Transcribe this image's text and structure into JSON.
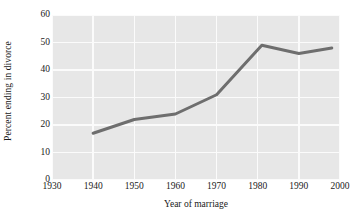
{
  "chart_data": {
    "type": "line",
    "title": "",
    "subtitle": "",
    "xlabel": "Year of marriage",
    "ylabel": "Percent ending in divorce",
    "xlim": [
      1930,
      2000
    ],
    "ylim": [
      0,
      60
    ],
    "xticks": [
      1930,
      1940,
      1950,
      1960,
      1970,
      1980,
      1990,
      2000
    ],
    "xtick_labels": [
      "1930",
      "1940",
      "1950",
      "1960",
      "1970",
      "1980",
      "1990",
      "2000"
    ],
    "yticks": [
      0,
      10,
      20,
      30,
      40,
      50,
      60
    ],
    "ytick_labels": [
      "0",
      "10",
      "20",
      "30",
      "40",
      "50",
      "60"
    ],
    "grid": true,
    "grid_color": "#fbfbfb",
    "plot_background": "#e7e7e7",
    "figure_background": "#ffffff",
    "legend": null,
    "legend_position": "none",
    "annotations": [],
    "series": [
      {
        "name": "Percent ending in divorce",
        "color": "#6e6e6e",
        "line_width": 3,
        "marker": "none",
        "x": [
          1940,
          1950,
          1960,
          1970,
          1981,
          1990,
          1998
        ],
        "values": [
          17,
          22,
          24,
          31,
          49,
          46,
          48
        ],
        "points": [
          {
            "x": 1940,
            "y": 17
          },
          {
            "x": 1950,
            "y": 22
          },
          {
            "x": 1960,
            "y": 24
          },
          {
            "x": 1970,
            "y": 31
          },
          {
            "x": 1981,
            "y": 49
          },
          {
            "x": 1990,
            "y": 46
          },
          {
            "x": 1998,
            "y": 48
          }
        ]
      }
    ]
  }
}
